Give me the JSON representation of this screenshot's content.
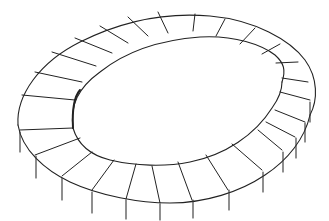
{
  "figure": {
    "stroke_color": "#222222",
    "background": "#ffffff",
    "outer_edge": "M18,125 C16,95 40,62 80,42 C120,22 165,12 210,16 C255,20 290,40 305,60 C318,78 318,100 310,115",
    "outer_bottom": "M18,125 C22,150 45,170 70,182 C100,196 140,203 170,203 C205,203 240,192 265,175 C288,160 305,138 310,115",
    "inner_top": "M73,128 C70,105 78,88 100,72 C125,52 160,40 200,37 C235,35 262,45 275,55 C284,63 286,70 282,82",
    "inner_bottom": "M73,128 C78,145 90,155 110,160 C135,166 165,167 190,162 C225,155 255,135 272,108 C280,97 282,90 282,82",
    "inner_wall": "M73,128 C72,110 74,97 80,90",
    "radials": [
      "M22,95 L75,100",
      "M35,72 L82,82",
      "M52,52 L96,66",
      "M75,38 L112,53",
      "M100,26 L128,43",
      "M128,17 L148,36",
      "M158,12 L168,33",
      "M195,14 L193,31",
      "M225,19 L216,36",
      "M255,28 L240,44",
      "M280,44 L262,54",
      "M298,62 L276,63",
      "M308,82 L282,78",
      "M310,100 L280,92",
      "M305,122 L275,110",
      "M295,137 L266,122",
      "M282,150 L258,130",
      "M262,170 L232,144",
      "M228,190 L206,155",
      "M192,200 L178,162",
      "M160,203 L152,166",
      "M126,199 L136,164",
      "M92,190 L114,160",
      "M62,176 L92,152",
      "M35,155 L80,138",
      "M20,130 L73,128"
    ],
    "columns": [
      {
        "x": 20,
        "y1": 132,
        "y2": 152
      },
      {
        "x": 36,
        "y1": 156,
        "y2": 178
      },
      {
        "x": 62,
        "y1": 178,
        "y2": 200
      },
      {
        "x": 92,
        "y1": 192,
        "y2": 213
      },
      {
        "x": 126,
        "y1": 200,
        "y2": 219
      },
      {
        "x": 160,
        "y1": 204,
        "y2": 220
      },
      {
        "x": 193,
        "y1": 200,
        "y2": 218
      },
      {
        "x": 229,
        "y1": 190,
        "y2": 210
      },
      {
        "x": 263,
        "y1": 172,
        "y2": 192
      },
      {
        "x": 283,
        "y1": 152,
        "y2": 172
      },
      {
        "x": 296,
        "y1": 138,
        "y2": 158
      },
      {
        "x": 305,
        "y1": 123,
        "y2": 142
      },
      {
        "x": 310,
        "y1": 102,
        "y2": 122
      }
    ]
  }
}
